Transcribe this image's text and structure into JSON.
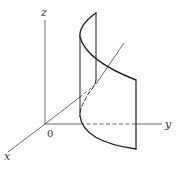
{
  "figure": {
    "type": "3d-surface-sketch",
    "axes": {
      "x_label": "x",
      "y_label": "y",
      "z_label": "z",
      "origin_label": "0"
    },
    "colors": {
      "stroke": "#222222",
      "axis": "#444444",
      "background": "#ffffff"
    }
  }
}
